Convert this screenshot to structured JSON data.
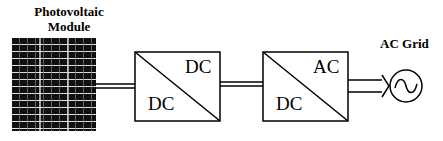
{
  "pv_module": {
    "label_line1": "Photovoltaic",
    "label_line2": "Module"
  },
  "converter1": {
    "output": "DC",
    "input": "DC"
  },
  "converter2": {
    "output": "AC",
    "input": "DC"
  },
  "grid": {
    "label": "AC Grid"
  }
}
